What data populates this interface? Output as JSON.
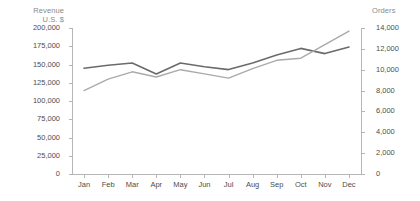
{
  "chart_data": {
    "type": "line",
    "title": "",
    "categories": [
      "Jan",
      "Feb",
      "Mar",
      "Apr",
      "May",
      "Jun",
      "Jul",
      "Aug",
      "Sep",
      "Oct",
      "Nov",
      "Dec"
    ],
    "grid": false,
    "legend": "none",
    "series": [
      {
        "name": "Revenue U.S. $",
        "axis": "left",
        "color": "#6b6b6b",
        "values": [
          145000,
          149000,
          152000,
          137000,
          152000,
          147000,
          143000,
          152000,
          163000,
          172000,
          165000,
          174000
        ]
      },
      {
        "name": "Orders",
        "axis": "right",
        "color": "#aaaaaa",
        "values": [
          8000,
          9100,
          9800,
          9300,
          10000,
          9600,
          9200,
          10100,
          10900,
          11100,
          12400,
          13700
        ]
      }
    ],
    "left_axis": {
      "label": "Revenue\nU.S. $",
      "min": 0,
      "max": 200000,
      "step": 25000,
      "ticks": [
        "0",
        "25,000",
        "50,000",
        "75,000",
        "100,000",
        "125,000",
        "150,000",
        "175,000",
        "200,000"
      ]
    },
    "right_axis": {
      "label": "Orders",
      "min": 0,
      "max": 14000,
      "step": 2000,
      "ticks": [
        "0",
        "2,000",
        "4,000",
        "6,000",
        "8,000",
        "10,000",
        "12,000",
        "14,000"
      ]
    },
    "xlabel": "",
    "colors": {
      "revenue_line": "#6b6b6b",
      "orders_line": "#aaaaaa",
      "axis": "#b6b6b6",
      "tick_text": "#4d4d4d",
      "axis_title_text": "#8a8a8a",
      "background": "#ffffff"
    }
  }
}
